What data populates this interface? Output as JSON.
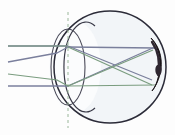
{
  "figure": {
    "canvas": {
      "width": 175,
      "height": 135,
      "background": "#fdfdfd"
    }
  },
  "colors": {
    "eyeball_outline": "#2b2b38",
    "eyeball_fill": "#f2f5f8",
    "lens_outline": "#4a4a58",
    "cornea_outline": "#3a3a48",
    "optical_axis_dashed": "#9ab79a",
    "ray_upper": "#7a7f9c",
    "ray_lower": "#7a9c7f",
    "retina_mark": "#1a1418",
    "retina_highlight": "#2e2630"
  },
  "parts": [
    {
      "name": "eyeball",
      "label": "Eyeball (sclera outline)",
      "shape": "circle",
      "cx": 110,
      "cy": 67,
      "r": 56
    },
    {
      "name": "cornea",
      "label": "Cornea (anterior bulge)",
      "shape": "arc",
      "cx": 73,
      "cy": 67,
      "rx": 22,
      "ry": 45
    },
    {
      "name": "lens",
      "label": "Crystalline lens",
      "shape": "ellipse",
      "cx": 68,
      "cy": 67,
      "rx": 17,
      "ry": 38
    },
    {
      "name": "retina-mark",
      "label": "Retina / focal mark",
      "shape": "crescent",
      "cx": 158,
      "cy": 67
    },
    {
      "name": "optical-axis",
      "label": "Optical axis (dashed)",
      "shape": "dashed-line",
      "x": 68,
      "y1": 12,
      "y2": 128
    }
  ],
  "rays": {
    "upper_bundle": {
      "name": "upper-ray-bundle",
      "color_key": "ray_upper",
      "label": "Upper light ray bundle",
      "segments": [
        {
          "id": "u1-incoming",
          "points": "8,46 68,46"
        },
        {
          "id": "u1-refracted",
          "points": "68,46 155,79"
        },
        {
          "id": "u2-incoming",
          "points": "8,62 55,53"
        },
        {
          "id": "u2-refracted",
          "points": "55,53 68,46 155,47"
        },
        {
          "id": "u3-horizontal",
          "points": "8,86 68,86"
        },
        {
          "id": "u3-refracted",
          "points": "68,86 155,47"
        }
      ]
    },
    "lower_bundle": {
      "name": "lower-ray-bundle",
      "color_key": "ray_lower",
      "label": "Lower light ray bundle",
      "segments": [
        {
          "id": "l1-incoming",
          "points": "8,46 68,46"
        },
        {
          "id": "l1-refracted",
          "points": "68,46 155,81"
        },
        {
          "id": "l2-incoming",
          "points": "8,74 55,80"
        },
        {
          "id": "l2-refracted",
          "points": "55,80 68,86 155,81"
        },
        {
          "id": "l3-refracted",
          "points": "68,86 155,49"
        }
      ]
    }
  },
  "chart_data": {
    "type": "scatter",
    "xlabel": "",
    "ylabel": "",
    "xlim": [
      0,
      175
    ],
    "ylim": [
      0,
      135
    ],
    "grid": false,
    "legend": "none",
    "annotations": [
      "Eyeball circle centered at (110, 67) with radius 56",
      "Crystalline lens ellipse centered at (68, 67), semi-axes 17 x 38",
      "Corneal arc centered at (73, 67), semi-axes 22 x 45",
      "Vertical dashed optical axis at x = 68",
      "Thick dark retina/focal crescent at right inner wall near (158, 67)",
      "Two ray bundles cross in an X between x = 80 and x = 150"
    ],
    "series": [
      {
        "name": "Upper ray bundle",
        "color": "#7a7f9c",
        "values": [
          46,
          62,
          86
        ]
      },
      {
        "name": "Lower ray bundle",
        "color": "#7a9c7f",
        "values": [
          46,
          74,
          86
        ]
      }
    ]
  }
}
